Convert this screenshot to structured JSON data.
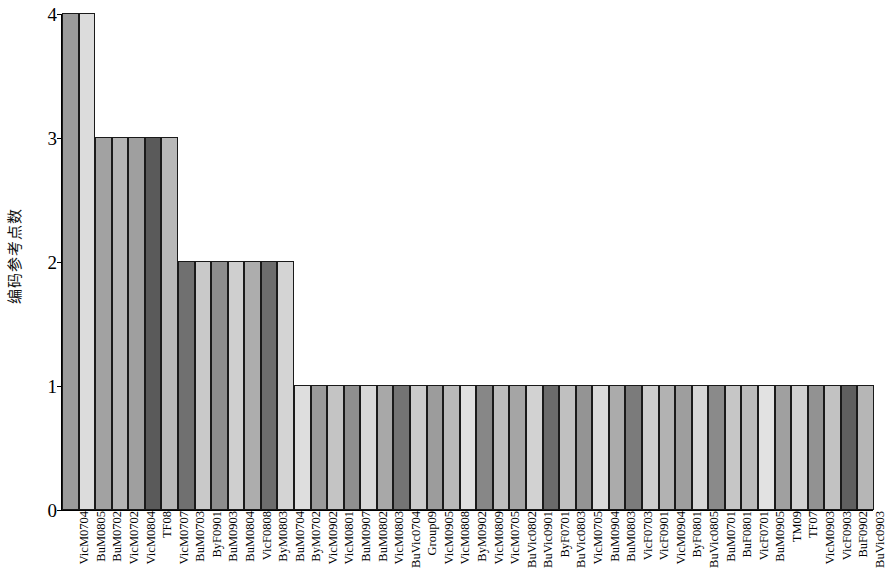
{
  "chart_data": {
    "type": "bar",
    "title": "",
    "xlabel": "",
    "ylabel": "编码参考点数",
    "ylim": [
      0,
      4
    ],
    "yticks": [
      0,
      1,
      2,
      3,
      4
    ],
    "ytick_labels": [
      "0",
      "1",
      "2",
      "3",
      "4"
    ],
    "grid": false,
    "legend": false,
    "categories": [
      "VicM0704",
      "BuM0805",
      "BuM0702",
      "VicM0702",
      "VicM0804",
      "TF08",
      "VicM0707",
      "BuM0703",
      "ByF0901",
      "BuM0903",
      "BuM0804",
      "VicF0808",
      "ByM0803",
      "BuM0704",
      "ByM0702",
      "VicM0902",
      "VicM0801",
      "BuM0907",
      "BuM0802",
      "VicM0803",
      "BuVic0704",
      "Group09",
      "VicM0905",
      "VicM0808",
      "ByM0902",
      "VicM0809",
      "VicM0705",
      "BuVic0802",
      "BuVic0901",
      "ByF0701",
      "BuVic0803",
      "VicM0705",
      "BuM0904",
      "BuM0803",
      "VicF0703",
      "VicF0901",
      "VicM0904",
      "ByF0801",
      "BuVic0805",
      "BuM0701",
      "BuF0801",
      "VicF0701",
      "BuM0905",
      "TM09",
      "TF07",
      "VicM0903",
      "VicF0903",
      "BuF0902",
      "BuVic0903"
    ],
    "values": [
      4,
      4,
      3,
      3,
      3,
      3,
      3,
      2,
      2,
      2,
      2,
      2,
      2,
      2,
      1,
      1,
      1,
      1,
      1,
      1,
      1,
      1,
      1,
      1,
      1,
      1,
      1,
      1,
      1,
      1,
      1,
      1,
      1,
      1,
      1,
      1,
      1,
      1,
      1,
      1,
      1,
      1,
      1,
      1,
      1,
      1,
      1,
      1,
      1
    ],
    "bar_fills": [
      "#9b9b9b",
      "#dcdcdc",
      "#a2a2a2",
      "#b4b4b4",
      "#9f9f9f",
      "#5a5a5a",
      "#b8b8b8",
      "#707070",
      "#c9c9c9",
      "#8d8d8d",
      "#cfcfcf",
      "#adadad",
      "#6d6d6d",
      "#d4d4d4",
      "#dedede",
      "#9a9a9a",
      "#c4c4c4",
      "#8f8f8f",
      "#d8d8d8",
      "#a8a8a8",
      "#747474",
      "#cbcbcb",
      "#9c9c9c",
      "#b9b9b9",
      "#e0e0e0",
      "#878787",
      "#bdbdbd",
      "#a5a5a5",
      "#d2d2d2",
      "#6b6b6b",
      "#c0c0c0",
      "#949494",
      "#dadada",
      "#ababab",
      "#7b7b7b",
      "#cdcdcd",
      "#b2b2b2",
      "#9e9e9e",
      "#d6d6d6",
      "#8a8a8a",
      "#c6c6c6",
      "#bbbbbb",
      "#e2e2e2",
      "#a0a0a0",
      "#d0d0d0",
      "#929292",
      "#c2c2c2",
      "#5f5f5f",
      "#b6b6b6"
    ]
  },
  "axis": {
    "y_label_text": "编码参考点数"
  }
}
